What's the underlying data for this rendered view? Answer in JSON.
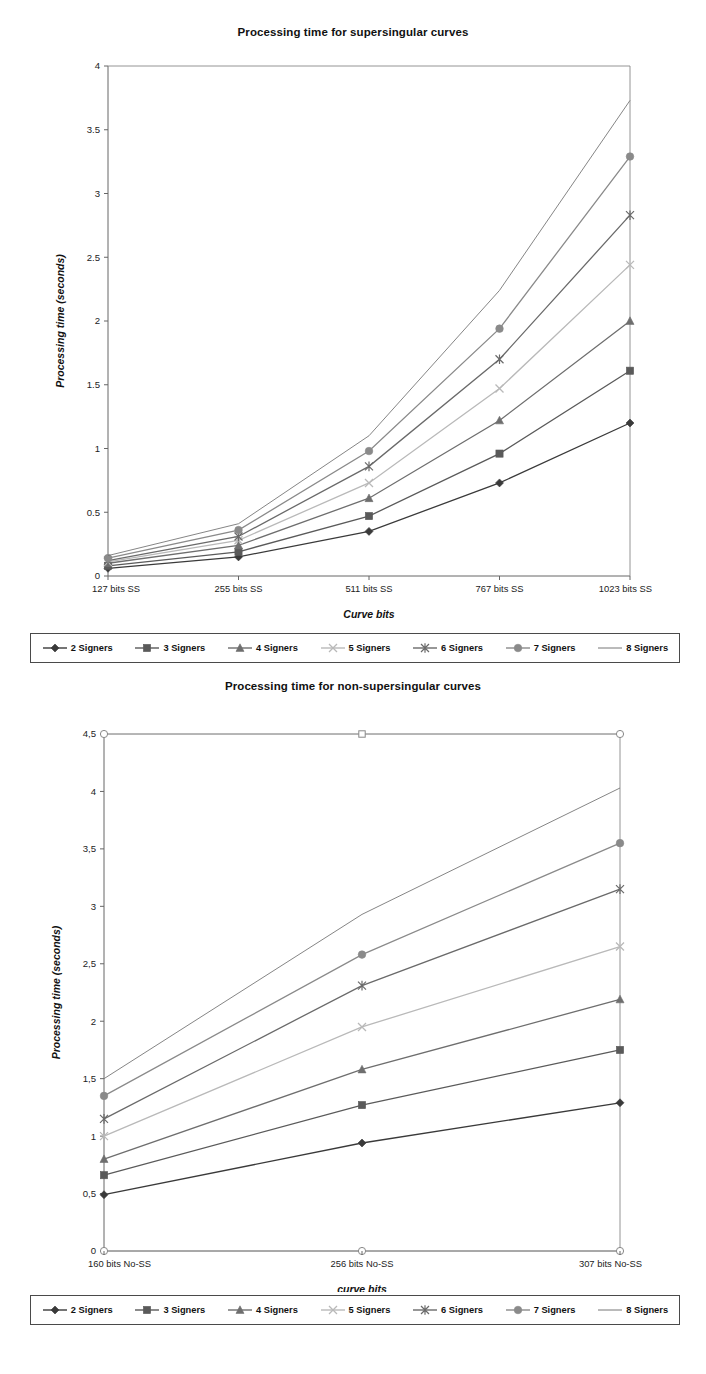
{
  "page": {
    "background": "#ffffff",
    "axis_color": "#555555"
  },
  "legend_entries": [
    {
      "label": "2 Signers",
      "marker": "diamond",
      "color": "#3a3a3a"
    },
    {
      "label": "3 Signers",
      "marker": "square",
      "color": "#5a5a5a"
    },
    {
      "label": "4 Signers",
      "marker": "triangle",
      "color": "#6e6e6e"
    },
    {
      "label": "5 Signers",
      "marker": "cross",
      "color": "#b9b9b9"
    },
    {
      "label": "6 Signers",
      "marker": "star",
      "color": "#6a6a6a"
    },
    {
      "label": "7 Signers",
      "marker": "circle",
      "color": "#8a8a8a"
    },
    {
      "label": "8 Signers",
      "marker": "none",
      "color": "#777777"
    }
  ],
  "chart_data": [
    {
      "id": "supersingular",
      "type": "line",
      "title": "Processing time for supersingular curves",
      "xlabel": "Curve bits",
      "ylabel": "Processing time (seconds)",
      "categories": [
        "127 bits SS",
        "255 bits SS",
        "511 bits SS",
        "767 bits SS",
        "1023 bits SS"
      ],
      "ylim": [
        0,
        4
      ],
      "ytick_step": 0.5,
      "ytick_labels": [
        "0",
        "0.5",
        "1",
        "1.5",
        "2",
        "2.5",
        "3",
        "3.5",
        "4"
      ],
      "grid": false,
      "legend_position": "below",
      "series": [
        {
          "name": "2 Signers",
          "marker": "diamond",
          "color": "#3a3a3a",
          "values": [
            0.06,
            0.15,
            0.35,
            0.73,
            1.2
          ]
        },
        {
          "name": "3 Signers",
          "marker": "square",
          "color": "#5a5a5a",
          "values": [
            0.08,
            0.19,
            0.47,
            0.96,
            1.61
          ]
        },
        {
          "name": "4 Signers",
          "marker": "triangle",
          "color": "#6e6e6e",
          "values": [
            0.1,
            0.24,
            0.61,
            1.22,
            2.0
          ]
        },
        {
          "name": "5 Signers",
          "marker": "cross",
          "color": "#b9b9b9",
          "values": [
            0.11,
            0.28,
            0.73,
            1.47,
            2.44
          ]
        },
        {
          "name": "6 Signers",
          "marker": "star",
          "color": "#6a6a6a",
          "values": [
            0.12,
            0.31,
            0.86,
            1.7,
            2.83
          ]
        },
        {
          "name": "7 Signers",
          "marker": "circle",
          "color": "#8a8a8a",
          "values": [
            0.14,
            0.36,
            0.98,
            1.94,
            3.29
          ]
        },
        {
          "name": "8 Signers",
          "marker": "none",
          "color": "#777777",
          "values": [
            0.16,
            0.41,
            1.1,
            2.24,
            3.73
          ]
        }
      ]
    },
    {
      "id": "non-supersingular",
      "type": "line",
      "title": "Processing time for non-supersingular curves",
      "xlabel": "curve bits",
      "ylabel": "Processing time (seconds)",
      "categories": [
        "160 bits No-SS",
        "256 bits No-SS",
        "307 bits No-SS"
      ],
      "ylim": [
        0,
        4.5
      ],
      "ytick_step": 0.5,
      "ytick_labels": [
        "0",
        "0,5",
        "1",
        "1,5",
        "2",
        "2,5",
        "3",
        "3,5",
        "4",
        "4,5"
      ],
      "grid": false,
      "legend_position": "below",
      "series": [
        {
          "name": "2 Signers",
          "marker": "diamond",
          "color": "#3a3a3a",
          "values": [
            0.49,
            0.94,
            1.29
          ]
        },
        {
          "name": "3 Signers",
          "marker": "square",
          "color": "#5a5a5a",
          "values": [
            0.66,
            1.27,
            1.75
          ]
        },
        {
          "name": "4 Signers",
          "marker": "triangle",
          "color": "#6e6e6e",
          "values": [
            0.8,
            1.58,
            2.19
          ]
        },
        {
          "name": "5 Signers",
          "marker": "cross",
          "color": "#b9b9b9",
          "values": [
            1.0,
            1.95,
            2.65
          ]
        },
        {
          "name": "6 Signers",
          "marker": "star",
          "color": "#6a6a6a",
          "values": [
            1.15,
            2.31,
            3.15
          ]
        },
        {
          "name": "7 Signers",
          "marker": "circle",
          "color": "#8a8a8a",
          "values": [
            1.35,
            2.58,
            3.55
          ]
        },
        {
          "name": "8 Signers",
          "marker": "none",
          "color": "#777777",
          "values": [
            1.5,
            2.93,
            4.03
          ]
        }
      ],
      "boundary_lines": [
        {
          "name": "top-frame",
          "value": 4.5,
          "marker": "circle-open"
        },
        {
          "name": "bottom-frame",
          "value": 0,
          "marker": "circle-open"
        }
      ]
    }
  ]
}
